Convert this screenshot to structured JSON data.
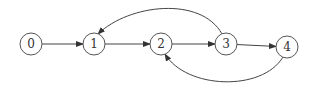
{
  "diagram": {
    "type": "directed-graph",
    "nodes": [
      {
        "id": "0",
        "label": "0"
      },
      {
        "id": "1",
        "label": "1"
      },
      {
        "id": "2",
        "label": "2"
      },
      {
        "id": "3",
        "label": "3"
      },
      {
        "id": "4",
        "label": "4"
      }
    ],
    "edges": [
      {
        "from": "0",
        "to": "1",
        "style": "straight"
      },
      {
        "from": "1",
        "to": "2",
        "style": "straight"
      },
      {
        "from": "2",
        "to": "3",
        "style": "straight"
      },
      {
        "from": "3",
        "to": "4",
        "style": "straight"
      },
      {
        "from": "3",
        "to": "1",
        "style": "curved-above"
      },
      {
        "from": "4",
        "to": "2",
        "style": "curved-below"
      }
    ],
    "colors": {
      "stroke": "#444444",
      "node_border": "#555555",
      "text": "#333333"
    }
  }
}
